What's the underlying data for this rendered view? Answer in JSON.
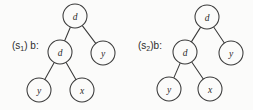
{
  "figure": {
    "background_color": "#fbfbfa",
    "ink_color": "#3a3a3a",
    "width": 253,
    "height": 110
  },
  "trees": [
    {
      "id": "tree-1",
      "label_prefix": "(s",
      "label_subscript": "1",
      "label_suffix": ") b:",
      "label_full": "(s1) b:",
      "nodes": [
        {
          "id": "root",
          "label": "d",
          "cx": 75,
          "cy": 16,
          "r": 12
        },
        {
          "id": "left-child",
          "label": "d",
          "cx": 60,
          "cy": 52,
          "r": 12
        },
        {
          "id": "right-child",
          "label": "y",
          "cx": 103,
          "cy": 53,
          "r": 12
        },
        {
          "id": "left-leaf",
          "label": "y",
          "cx": 39,
          "cy": 90,
          "r": 12
        },
        {
          "id": "right-leaf",
          "label": "x",
          "cx": 82,
          "cy": 90,
          "r": 12
        }
      ],
      "edges": [
        {
          "from": "root",
          "to": "left-child"
        },
        {
          "from": "root",
          "to": "right-child"
        },
        {
          "from": "left-child",
          "to": "left-leaf"
        },
        {
          "from": "left-child",
          "to": "right-leaf"
        }
      ]
    },
    {
      "id": "tree-2",
      "label_prefix": "(s",
      "label_subscript": "2",
      "label_suffix": ")b:",
      "label_full": "(s2)b:",
      "nodes": [
        {
          "id": "root",
          "label": "d",
          "cx": 81,
          "cy": 17,
          "r": 12
        },
        {
          "id": "left-child",
          "label": "d",
          "cx": 59,
          "cy": 52,
          "r": 12
        },
        {
          "id": "right-child",
          "label": "y",
          "cx": 105,
          "cy": 53,
          "r": 12
        },
        {
          "id": "left-leaf",
          "label": "y",
          "cx": 43,
          "cy": 89,
          "r": 12
        },
        {
          "id": "right-leaf",
          "label": "x",
          "cx": 84,
          "cy": 89,
          "r": 12
        }
      ],
      "edges": [
        {
          "from": "root",
          "to": "left-child"
        },
        {
          "from": "root",
          "to": "right-child"
        },
        {
          "from": "left-child",
          "to": "left-leaf"
        },
        {
          "from": "left-child",
          "to": "right-leaf"
        }
      ]
    }
  ]
}
